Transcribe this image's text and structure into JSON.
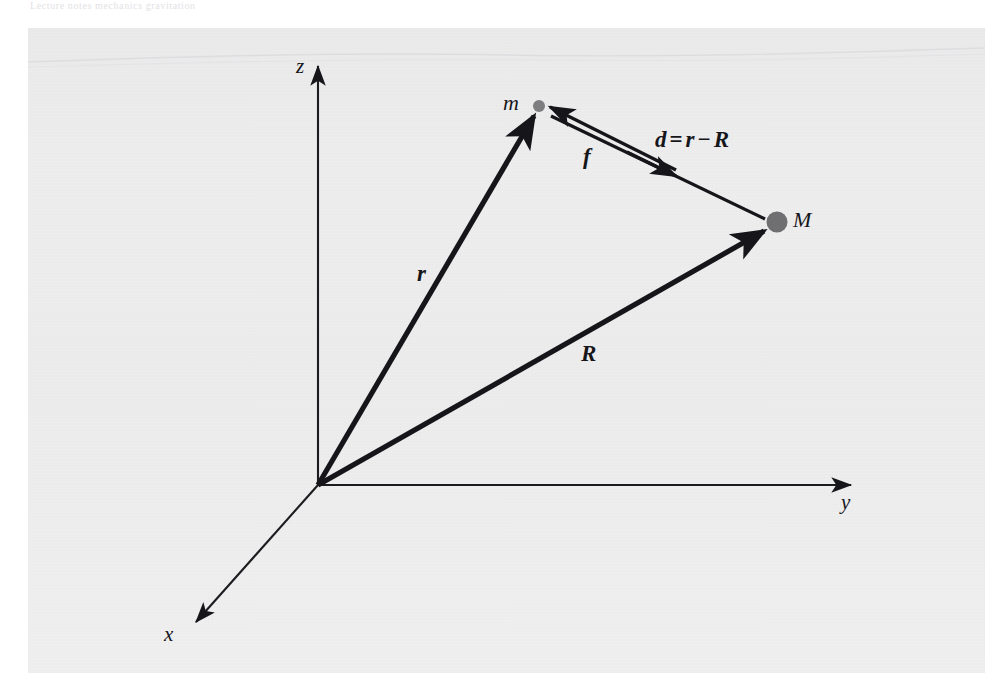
{
  "figure": {
    "background_color": "#eeeeef",
    "page_color": "#ffffff",
    "ink_color": "#16161a",
    "mass_dot_color": "#808080",
    "header_ghost_text": "Lecture notes   mechanics   gravitation"
  },
  "axes": [
    {
      "name": "z-axis",
      "label": "z",
      "direction": "up",
      "label_x": 296,
      "label_y": 56
    },
    {
      "name": "y-axis",
      "label": "y",
      "direction": "right",
      "label_x": 841,
      "label_y": 492
    },
    {
      "name": "x-axis",
      "label": "x",
      "direction": "down-left",
      "label_x": 164,
      "label_y": 624
    }
  ],
  "origin": {
    "label": "O",
    "x": 318,
    "y": 485
  },
  "masses": [
    {
      "name": "small-mass",
      "label": "m",
      "x": 539,
      "y": 106,
      "dot_radius": 6,
      "label_x": 503,
      "label_y": 92
    },
    {
      "name": "large-mass",
      "label": "M",
      "x": 777,
      "y": 222,
      "dot_radius": 10,
      "label_x": 793,
      "label_y": 209
    }
  ],
  "vectors": [
    {
      "name": "position-vector-r",
      "label": "r",
      "from": "origin",
      "to": "m",
      "x1": 318,
      "y1": 485,
      "x2": 536,
      "y2": 112,
      "label_x": 417,
      "label_y": 262
    },
    {
      "name": "position-vector-R",
      "label": "R",
      "from": "origin",
      "to": "M",
      "x1": 318,
      "y1": 485,
      "x2": 768,
      "y2": 228,
      "label_x": 581,
      "label_y": 342
    },
    {
      "name": "separation-vector-d",
      "label": "d",
      "equation": "d = r − R",
      "from": "m",
      "to": "M",
      "x1": 548,
      "y1": 112,
      "x2": 767,
      "y2": 217,
      "arrow_tip_x": 688,
      "arrow_tip_y": 178,
      "label_x": 655,
      "label_y": 128
    },
    {
      "name": "force-vector-f",
      "label": "f",
      "from": "M-side",
      "to": "m",
      "x1": 672,
      "y1": 170,
      "x2": 549,
      "y2": 108,
      "label_x": 583,
      "label_y": 145
    }
  ],
  "equation": {
    "lhs": "d",
    "operator_equals": "=",
    "term1": "r",
    "operator_minus": "−",
    "term2": "R",
    "full": "d = r − R"
  }
}
